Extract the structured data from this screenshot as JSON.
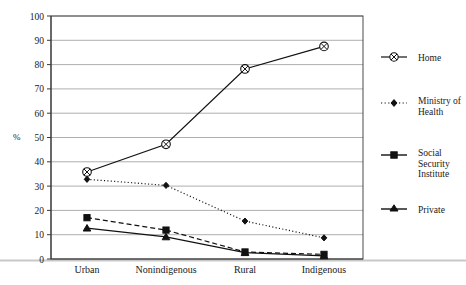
{
  "chart_data": {
    "type": "line",
    "title": "",
    "xlabel": "",
    "ylabel": "%",
    "categories": [
      "Urban",
      "Nonindigenous",
      "Rural",
      "Indigenous"
    ],
    "ylim": [
      0,
      100
    ],
    "yticks": [
      0,
      10,
      20,
      30,
      40,
      50,
      60,
      70,
      80,
      90,
      100
    ],
    "grid": true,
    "legend_position": "right",
    "series": [
      {
        "name": "Home",
        "marker": "circle-cross",
        "linestyle": "solid",
        "values": [
          35.8,
          47.2,
          78.2,
          87.5
        ]
      },
      {
        "name": "Ministry of Health",
        "marker": "diamond",
        "linestyle": "dotted",
        "values": [
          32.8,
          30.3,
          15.6,
          8.7
        ]
      },
      {
        "name": "Social Security Institute",
        "marker": "square",
        "linestyle": "dashed",
        "values": [
          17.0,
          11.9,
          2.9,
          1.9
        ]
      },
      {
        "name": "Private",
        "marker": "triangle",
        "linestyle": "solid",
        "values": [
          12.7,
          9.1,
          2.6,
          1.3
        ]
      }
    ]
  },
  "axis": {
    "y_title": "%",
    "y_tick_labels": [
      "100",
      "90",
      "80",
      "70",
      "60",
      "50",
      "40",
      "30",
      "20",
      "10",
      "0"
    ],
    "x_tick_labels": [
      "Urban",
      "Nonindigenous",
      "Rural",
      "Indigenous"
    ]
  },
  "legend": {
    "entries": [
      {
        "label": "Home",
        "line1": "Home",
        "line2": ""
      },
      {
        "label": "Ministry of Health",
        "line1": "Ministry of",
        "line2": "Health"
      },
      {
        "label": "Social Security Institute",
        "line1": "Social",
        "line2": "Security",
        "line3": "Institute"
      },
      {
        "label": "Private",
        "line1": "Private",
        "line2": ""
      }
    ]
  },
  "colors": {
    "ink": "#111111",
    "grid": "#8d8d8d",
    "frame": "#4a4a4a",
    "background": "#ffffff"
  }
}
